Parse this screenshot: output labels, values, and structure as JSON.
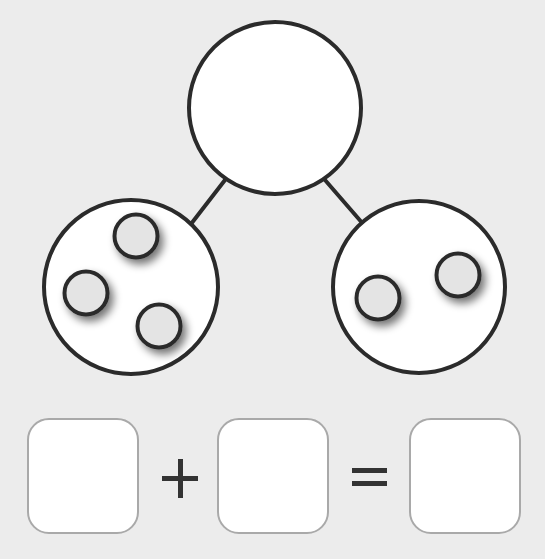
{
  "worksheet": {
    "type": "number-bond",
    "whole_circle": {
      "value": "",
      "label": "whole"
    },
    "parts": [
      {
        "label": "left part",
        "counter_count": 3,
        "counters": [
          {
            "cx": 136,
            "cy": 236
          },
          {
            "cx": 86,
            "cy": 293
          },
          {
            "cx": 159,
            "cy": 326
          }
        ]
      },
      {
        "label": "right part",
        "counter_count": 2,
        "counters": [
          {
            "cx": 378,
            "cy": 298
          },
          {
            "cx": 458,
            "cy": 275
          }
        ]
      }
    ],
    "equation": {
      "addend_1": "",
      "operator_plus": "+",
      "addend_2": "",
      "operator_equals": "=",
      "sum": ""
    }
  },
  "colors": {
    "background": "#ececec",
    "outline": "#2b2b2b",
    "circle_fill": "#ffffff",
    "counter_fill": "#e4e4e4",
    "box_border": "#a9a9a9",
    "operator": "#333333"
  }
}
